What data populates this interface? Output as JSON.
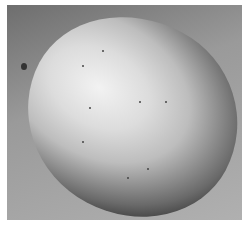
{
  "image": {
    "description": "Grayscale photograph of a single apple on a gray background",
    "subject": "apple",
    "colors": {
      "border": "#ffffff",
      "background": "#9a9a9a",
      "highlight": "#f2f2f2",
      "shadow": "#111111"
    }
  }
}
